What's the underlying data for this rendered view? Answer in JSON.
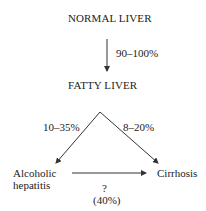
{
  "diagram": {
    "nodes": {
      "normal_liver": "NORMAL LIVER",
      "fatty_liver": "FATTY LIVER",
      "alcoholic_hepatitis_line1": "Alcoholic",
      "alcoholic_hepatitis_line2": "hepatitis",
      "cirrhosis": "Cirrhosis"
    },
    "edges": {
      "normal_to_fatty": "90–100%",
      "fatty_to_hepatitis": "10–35%",
      "fatty_to_cirrhosis": "8–20%",
      "hepatitis_to_cirrhosis_q": "?",
      "hepatitis_to_cirrhosis_pct": "(40%)"
    },
    "colors": {
      "line": "#333333",
      "text": "#222222",
      "background": "#ffffff"
    }
  }
}
